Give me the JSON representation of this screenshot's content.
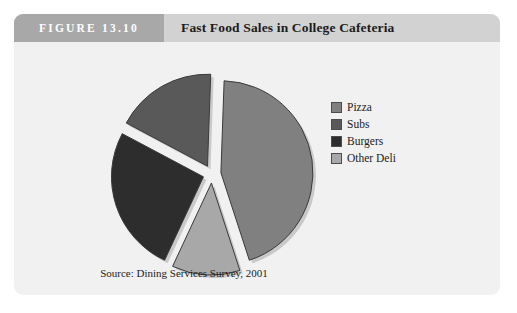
{
  "figure": {
    "number_label": "FIGURE 13.10",
    "title": "Fast Food Sales in College Cafeteria",
    "source_note": "Source: Dining Services Survey, 2001"
  },
  "legend": {
    "items": [
      {
        "label": "Pizza",
        "color": "#808080"
      },
      {
        "label": "Subs",
        "color": "#595959"
      },
      {
        "label": "Burgers",
        "color": "#2d2d2d"
      },
      {
        "label": "Other Deli",
        "color": "#a8a8a8"
      }
    ]
  },
  "colors": {
    "card_background": "#f1f1f1",
    "header_band": "#d2d2d2",
    "figure_number_band": "#a8a8a8",
    "slice_outline": "#3a3a3a",
    "page_background": "#ffffff"
  },
  "chart_data": {
    "type": "pie",
    "title": "Fast Food Sales in College Cafeteria",
    "xlabel": "",
    "ylabel": "",
    "exploded": true,
    "legend_position": "right",
    "grid": false,
    "categories": [
      "Pizza",
      "Subs",
      "Burgers",
      "Other Deli"
    ],
    "values": [
      44,
      18,
      26,
      12
    ],
    "unit": "percent",
    "slices": [
      {
        "label": "Pizza",
        "value": 44,
        "color": "#808080",
        "start_angle_deg": -88,
        "end_angle_deg": 72,
        "explode_offset_px": 9
      },
      {
        "label": "Other Deli",
        "value": 12,
        "color": "#a8a8a8",
        "start_angle_deg": 72,
        "end_angle_deg": 115,
        "explode_offset_px": 9
      },
      {
        "label": "Burgers",
        "value": 26,
        "color": "#2d2d2d",
        "start_angle_deg": 115,
        "end_angle_deg": 208,
        "explode_offset_px": 9
      },
      {
        "label": "Subs",
        "value": 18,
        "color": "#595959",
        "start_angle_deg": 208,
        "end_angle_deg": 272,
        "explode_offset_px": 9
      }
    ],
    "geometry": {
      "center_x": 198,
      "center_y": 132,
      "radius": 92
    }
  }
}
